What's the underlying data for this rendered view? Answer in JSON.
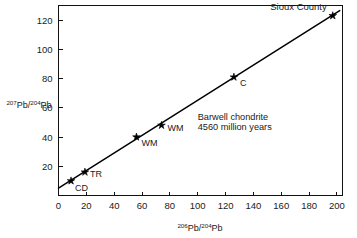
{
  "chart_data": {
    "type": "scatter",
    "title": "",
    "subtitle": "",
    "xlabel": "206Pb/204Pb",
    "ylabel": "207Pb/204Pb",
    "xlabel_parts": {
      "sup1": "206",
      "base1": "Pb",
      "slash": "/",
      "sup2": "204",
      "base2": "Pb"
    },
    "ylabel_parts": {
      "sup1": "207",
      "base1": "Pb",
      "slash": "/",
      "sup2": "204",
      "base2": "Pb"
    },
    "xlim": [
      0,
      204
    ],
    "ylim": [
      0,
      130
    ],
    "xticks": [
      0,
      20,
      40,
      60,
      80,
      100,
      120,
      140,
      160,
      180,
      200
    ],
    "yticks": [
      20,
      40,
      60,
      80,
      100,
      120
    ],
    "xticklabels": [
      "0",
      "20",
      "40",
      "60",
      "80",
      "100",
      "120",
      "140",
      "160",
      "180",
      "200"
    ],
    "yticklabels": [
      "20",
      "40",
      "60",
      "80",
      "100",
      "120"
    ],
    "grid": false,
    "legend": "none",
    "points": [
      {
        "label": "CD",
        "x": 9,
        "y": 10,
        "label_dx": 4,
        "label_dy": 10
      },
      {
        "label": "TR",
        "x": 19,
        "y": 16,
        "label_dx": 5,
        "label_dy": 5
      },
      {
        "label": "WM",
        "x": 56,
        "y": 40,
        "label_dx": 5,
        "label_dy": 9
      },
      {
        "label": "WM",
        "x": 74,
        "y": 48,
        "label_dx": 6,
        "label_dy": 6
      },
      {
        "label": "C",
        "x": 126,
        "y": 81,
        "label_dx": 6,
        "label_dy": 9
      },
      {
        "label": "Sioux County",
        "x": 197,
        "y": 123,
        "label_dx": -6,
        "label_dy": -6
      }
    ],
    "fit_line": {
      "x0": 0,
      "y0": 5.0,
      "x1": 202,
      "y1": 126.5
    },
    "annotations": [
      {
        "text": "Barwell chondrite",
        "x": 100,
        "y": 52
      },
      {
        "text": "4560 million years",
        "x": 100,
        "y": 45
      }
    ],
    "corner_label": "Sioux County"
  },
  "axes": {
    "x_title": "206Pb/204Pb",
    "y_title": "207Pb/204Pb"
  }
}
